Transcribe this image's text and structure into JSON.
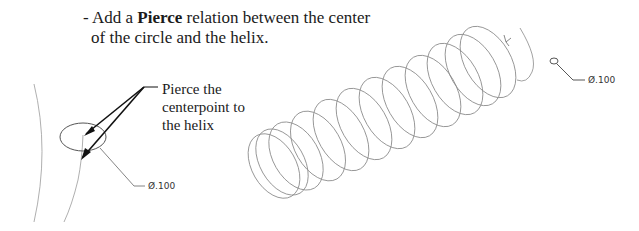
{
  "instruction": {
    "prefix": "- Add a ",
    "bold_term": "Pierce",
    "suffix": " relation between the center",
    "line2": "of the circle and the helix."
  },
  "callout": {
    "lines": [
      "Pierce the",
      "centerpoint to",
      "the helix"
    ]
  },
  "left_view": {
    "dimension_label": "Ø.100"
  },
  "right_view": {
    "dimension_label": "Ø.100",
    "helix_turns": 11
  },
  "colors": {
    "text": "#1a1a1a",
    "sketch_line": "#8a8a8a",
    "leader_arrow": "#111111"
  }
}
